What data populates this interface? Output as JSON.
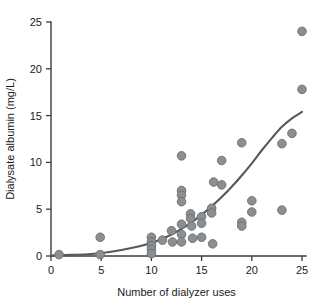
{
  "chart_data": {
    "type": "scatter",
    "title": "",
    "xlabel": "Number of dialyzer uses",
    "ylabel": "Dialysate albumin (mg/L)",
    "xlim": [
      0,
      25.8
    ],
    "ylim": [
      0,
      25.6
    ],
    "xticks": [
      0,
      5,
      10,
      15,
      20,
      25
    ],
    "yticks": [
      0,
      5,
      10,
      15,
      20,
      25
    ],
    "xtick_labels": [
      "0",
      "5",
      "10",
      "15",
      "20",
      "25"
    ],
    "ytick_labels": [
      "0",
      "5",
      "10",
      "15",
      "20",
      "25"
    ],
    "grid": false,
    "legend": null,
    "marker_color": "#8c8f91",
    "marker_edge_color": "#6a6d6f",
    "curve_color": "#56595b",
    "axis_color": "#3b3b3b",
    "points": [
      {
        "x": 0.8,
        "y": 0.15
      },
      {
        "x": 4.9,
        "y": 2.0
      },
      {
        "x": 4.9,
        "y": 0.15
      },
      {
        "x": 10.0,
        "y": 2.0
      },
      {
        "x": 10.0,
        "y": 1.5
      },
      {
        "x": 10.0,
        "y": 1.1
      },
      {
        "x": 10.0,
        "y": 0.7
      },
      {
        "x": 10.0,
        "y": 0.25
      },
      {
        "x": 11.1,
        "y": 1.7
      },
      {
        "x": 12.0,
        "y": 2.7
      },
      {
        "x": 12.1,
        "y": 1.5
      },
      {
        "x": 13.0,
        "y": 10.7
      },
      {
        "x": 13.0,
        "y": 7.0
      },
      {
        "x": 13.0,
        "y": 6.5
      },
      {
        "x": 13.0,
        "y": 5.8
      },
      {
        "x": 13.0,
        "y": 3.4
      },
      {
        "x": 13.0,
        "y": 2.3
      },
      {
        "x": 13.0,
        "y": 1.5
      },
      {
        "x": 13.9,
        "y": 4.5
      },
      {
        "x": 13.9,
        "y": 4.0
      },
      {
        "x": 14.0,
        "y": 3.2
      },
      {
        "x": 14.1,
        "y": 1.9
      },
      {
        "x": 15.0,
        "y": 4.2
      },
      {
        "x": 15.0,
        "y": 3.5
      },
      {
        "x": 15.0,
        "y": 2.0
      },
      {
        "x": 16.0,
        "y": 5.1
      },
      {
        "x": 16.0,
        "y": 4.6
      },
      {
        "x": 16.1,
        "y": 1.3
      },
      {
        "x": 16.2,
        "y": 7.9
      },
      {
        "x": 17.0,
        "y": 10.2
      },
      {
        "x": 17.0,
        "y": 7.6
      },
      {
        "x": 19.0,
        "y": 12.1
      },
      {
        "x": 19.0,
        "y": 3.6
      },
      {
        "x": 19.0,
        "y": 3.2
      },
      {
        "x": 20.0,
        "y": 5.9
      },
      {
        "x": 20.0,
        "y": 4.7
      },
      {
        "x": 23.0,
        "y": 12.0
      },
      {
        "x": 23.0,
        "y": 4.9
      },
      {
        "x": 24.0,
        "y": 13.1
      },
      {
        "x": 25.0,
        "y": 24.0
      },
      {
        "x": 25.0,
        "y": 17.8
      }
    ],
    "fit_curve": {
      "description": "monotonic increasing fitted curve",
      "points": [
        {
          "x": 0.0,
          "y": 0.05
        },
        {
          "x": 2.0,
          "y": 0.12
        },
        {
          "x": 4.0,
          "y": 0.22
        },
        {
          "x": 6.0,
          "y": 0.45
        },
        {
          "x": 8.0,
          "y": 0.85
        },
        {
          "x": 10.0,
          "y": 1.4
        },
        {
          "x": 11.0,
          "y": 1.8
        },
        {
          "x": 12.0,
          "y": 2.3
        },
        {
          "x": 13.0,
          "y": 2.9
        },
        {
          "x": 14.0,
          "y": 3.6
        },
        {
          "x": 15.0,
          "y": 4.4
        },
        {
          "x": 16.0,
          "y": 5.3
        },
        {
          "x": 17.0,
          "y": 6.3
        },
        {
          "x": 18.0,
          "y": 7.4
        },
        {
          "x": 19.0,
          "y": 8.6
        },
        {
          "x": 20.0,
          "y": 9.9
        },
        {
          "x": 21.0,
          "y": 11.3
        },
        {
          "x": 22.0,
          "y": 12.6
        },
        {
          "x": 23.0,
          "y": 13.8
        },
        {
          "x": 24.0,
          "y": 14.7
        },
        {
          "x": 25.0,
          "y": 15.4
        }
      ]
    }
  }
}
